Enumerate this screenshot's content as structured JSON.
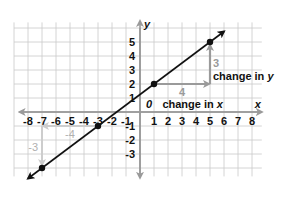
{
  "chart_data": {
    "type": "line",
    "title": "",
    "xlabel": "x",
    "ylabel": "y",
    "origin_label": "0",
    "xlim": [
      -8,
      8
    ],
    "ylim": [
      -3,
      5
    ],
    "x_ticks": [
      -8,
      -7,
      -6,
      -5,
      -4,
      -3,
      -2,
      -1,
      1,
      2,
      3,
      4,
      5,
      6,
      7,
      8
    ],
    "y_ticks": [
      -3,
      -2,
      -1,
      1,
      2,
      3,
      4,
      5
    ],
    "grid": true,
    "series": [
      {
        "name": "line y = 0.75x + 1.25",
        "color": "#111111",
        "points": [
          {
            "x": -7,
            "y": -4
          },
          {
            "x": -3,
            "y": -1
          },
          {
            "x": 1,
            "y": 2
          },
          {
            "x": 5,
            "y": 5
          }
        ]
      }
    ],
    "annotations": [
      {
        "type": "arrow",
        "from": [
          1,
          2
        ],
        "to": [
          5,
          2
        ],
        "label": "4",
        "color": "#9a9a9a"
      },
      {
        "type": "arrow",
        "from": [
          5,
          2
        ],
        "to": [
          5,
          5
        ],
        "label": "3",
        "color": "#9a9a9a"
      },
      {
        "type": "arrow",
        "from": [
          -3,
          -1
        ],
        "to": [
          -7,
          -1
        ],
        "label": "-4",
        "color": "#c8c8c8"
      },
      {
        "type": "arrow",
        "from": [
          -7,
          -1
        ],
        "to": [
          -7,
          -4
        ],
        "label": "-3",
        "color": "#c8c8c8"
      },
      {
        "type": "text",
        "text": "change in x"
      },
      {
        "type": "text",
        "text": "change in y"
      }
    ]
  },
  "labels": {
    "change_x": "change in ",
    "change_x_var": "x",
    "change_y": "change in ",
    "change_y_var": "y",
    "run_pos": "4",
    "rise_pos": "3",
    "run_neg": "-4",
    "rise_neg": "-3",
    "axis_x": "x",
    "axis_y": "y",
    "origin": "0"
  },
  "colors": {
    "grid": "#c9c9c9",
    "axis": "#9a9a9a",
    "line": "#111111",
    "arrow_dark": "#9a9a9a",
    "arrow_light": "#cdcdcd",
    "text": "#111111"
  }
}
